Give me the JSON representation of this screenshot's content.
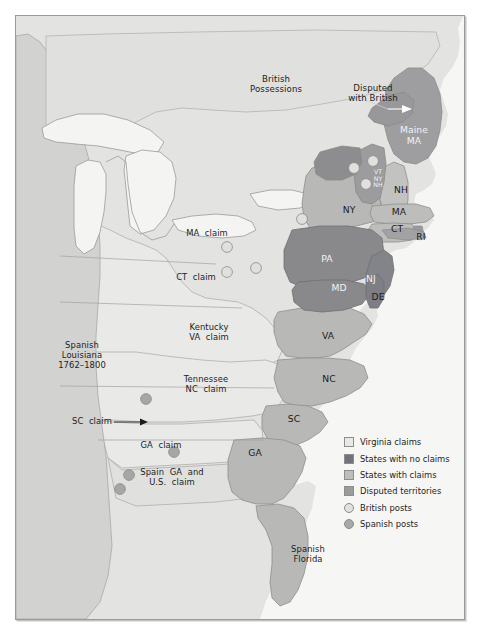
{
  "map": {
    "title": "Western Land Claims of the Original States, 1762-1800",
    "colors": {
      "background": "#e3e3e2",
      "ocean": "#f4f4f3",
      "virginia_claims": "#e8e8e6",
      "states_no_claims": "#8b8b8e",
      "states_with_claims": "#b6b6b5",
      "disputed_territories": "#9c9c9e",
      "british_post": "#e0e0de",
      "spanish_post": "#a6a6a5",
      "spanish_louisiana": "#cfcfce",
      "lakes": "#f2f2f1",
      "border": "#9a9a99",
      "label_dark": "#1c1c1c",
      "label_light": "#f2f2f2"
    },
    "labels": [
      {
        "id": "british-possessions",
        "text": "British\nPossessions",
        "x": 260,
        "y": 68,
        "style": "big"
      },
      {
        "id": "disputed-with-british",
        "text": "Disputed\nwith British",
        "x": 357,
        "y": 77,
        "style": "big"
      },
      {
        "id": "maine-ma",
        "text": "Maine\nMA",
        "x": 398,
        "y": 120,
        "style": "state",
        "light": true
      },
      {
        "id": "vt-ny-nh",
        "text": "VT\nNY\nNH",
        "x": 362,
        "y": 163,
        "style": "tiny",
        "light": true
      },
      {
        "id": "nh",
        "text": "NH",
        "x": 385,
        "y": 174,
        "style": "state"
      },
      {
        "id": "ny",
        "text": "NY",
        "x": 333,
        "y": 194,
        "style": "state"
      },
      {
        "id": "ma",
        "text": "MA",
        "x": 383,
        "y": 196,
        "style": "state"
      },
      {
        "id": "ct",
        "text": "CT",
        "x": 381,
        "y": 213,
        "style": "state"
      },
      {
        "id": "ri",
        "text": "RI",
        "x": 405,
        "y": 221,
        "style": "state"
      },
      {
        "id": "pa",
        "text": "PA",
        "x": 311,
        "y": 243,
        "style": "state",
        "light": true
      },
      {
        "id": "nj",
        "text": "NJ",
        "x": 355,
        "y": 263,
        "style": "state",
        "light": true
      },
      {
        "id": "md",
        "text": "MD",
        "x": 323,
        "y": 272,
        "style": "state",
        "light": true
      },
      {
        "id": "de",
        "text": "DE",
        "x": 362,
        "y": 281,
        "style": "state"
      },
      {
        "id": "ma-claim",
        "text": "MA  claim",
        "x": 191,
        "y": 218,
        "style": "claim"
      },
      {
        "id": "ct-claim",
        "text": "CT  claim",
        "x": 180,
        "y": 262,
        "style": "claim"
      },
      {
        "id": "kentucky-va-claim",
        "text": "Kentucky\nVA  claim",
        "x": 193,
        "y": 317,
        "style": "claim"
      },
      {
        "id": "tennessee-nc-claim",
        "text": "Tennessee\nNC  claim",
        "x": 190,
        "y": 369,
        "style": "claim"
      },
      {
        "id": "spanish-louisiana",
        "text": "Spanish\nLouisiana\n1762–1800",
        "x": 66,
        "y": 340,
        "style": "claim"
      },
      {
        "id": "va",
        "text": "VA",
        "x": 312,
        "y": 320,
        "style": "state"
      },
      {
        "id": "nc",
        "text": "NC",
        "x": 313,
        "y": 363,
        "style": "state"
      },
      {
        "id": "sc",
        "text": "SC",
        "x": 278,
        "y": 403,
        "style": "state"
      },
      {
        "id": "sc-claim",
        "text": "SC  claim",
        "x": 76,
        "y": 406,
        "style": "claim"
      },
      {
        "id": "ga-claim",
        "text": "GA  claim",
        "x": 145,
        "y": 430,
        "style": "claim"
      },
      {
        "id": "ga",
        "text": "GA",
        "x": 239,
        "y": 437,
        "style": "state"
      },
      {
        "id": "spain-ga-us-claim",
        "text": "Spain  GA  and\nU.S.  claim",
        "x": 156,
        "y": 462,
        "style": "claim"
      },
      {
        "id": "spanish-florida",
        "text": "Spanish\nFlorida",
        "x": 292,
        "y": 539,
        "style": "claim"
      }
    ],
    "british_posts": [
      {
        "x": 211,
        "y": 231
      },
      {
        "x": 211,
        "y": 256
      },
      {
        "x": 240,
        "y": 252
      },
      {
        "x": 286,
        "y": 203
      },
      {
        "x": 338,
        "y": 152
      },
      {
        "x": 357,
        "y": 145
      },
      {
        "x": 350,
        "y": 168
      }
    ],
    "spanish_posts": [
      {
        "x": 130,
        "y": 383
      },
      {
        "x": 158,
        "y": 436
      },
      {
        "x": 113,
        "y": 459
      },
      {
        "x": 104,
        "y": 473
      }
    ]
  },
  "legend": {
    "items": [
      {
        "id": "virginia-claims",
        "label": "Virginia claims",
        "symbol": "square",
        "color": "#e8e8e6"
      },
      {
        "id": "states-no-claims",
        "label": "States with no claims",
        "symbol": "square",
        "color": "#72727a"
      },
      {
        "id": "states-with-claims",
        "label": "States with claims",
        "symbol": "square",
        "color": "#bdbdbc"
      },
      {
        "id": "disputed-territories",
        "label": "Disputed territories",
        "symbol": "square",
        "color": "#9c9c9e"
      },
      {
        "id": "british-posts",
        "label": "British posts",
        "symbol": "circle",
        "color": "#e0e0de"
      },
      {
        "id": "spanish-posts",
        "label": "Spanish posts",
        "symbol": "circle",
        "color": "#a8a8a7"
      }
    ]
  }
}
